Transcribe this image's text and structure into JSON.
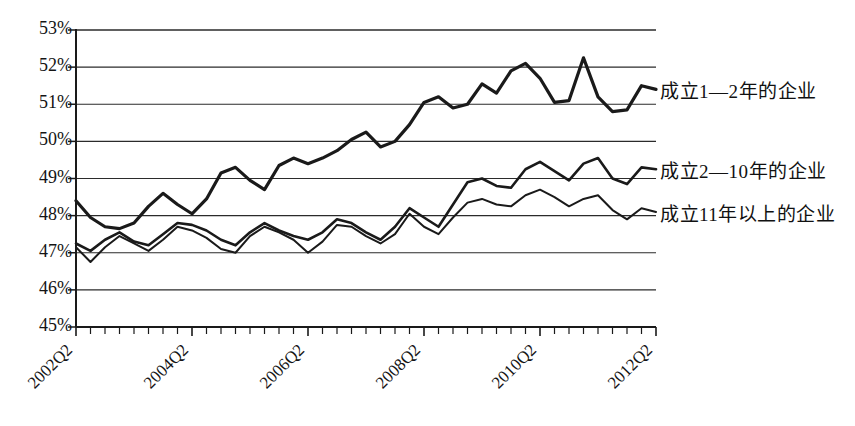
{
  "chart_data": {
    "type": "line",
    "title": "",
    "xlabel": "",
    "ylabel": "",
    "ylim": [
      45,
      53
    ],
    "ytick_labels": [
      "53%",
      "52%",
      "51%",
      "50%",
      "49%",
      "48%",
      "47%",
      "46%",
      "45%"
    ],
    "ytick_values": [
      53,
      52,
      51,
      50,
      49,
      48,
      47,
      46,
      45
    ],
    "grid": true,
    "legend_position": "right-inline",
    "x_start": "2002Q2",
    "x_end": "2012Q2",
    "x_tick_count": 41,
    "xtick_labels": [
      "2002Q2",
      "2004Q2",
      "2006Q2",
      "2008Q2",
      "2010Q2",
      "2012Q2"
    ],
    "xtick_indices": [
      0,
      8,
      16,
      24,
      32,
      40
    ],
    "x": [
      "2002Q2",
      "2002Q3",
      "2002Q4",
      "2003Q1",
      "2003Q2",
      "2003Q3",
      "2003Q4",
      "2004Q1",
      "2004Q2",
      "2004Q3",
      "2004Q4",
      "2005Q1",
      "2005Q2",
      "2005Q3",
      "2005Q4",
      "2006Q1",
      "2006Q2",
      "2006Q3",
      "2006Q4",
      "2007Q1",
      "2007Q2",
      "2007Q3",
      "2007Q4",
      "2008Q1",
      "2008Q2",
      "2008Q3",
      "2008Q4",
      "2009Q1",
      "2009Q2",
      "2009Q3",
      "2009Q4",
      "2010Q1",
      "2010Q2",
      "2010Q3",
      "2010Q4",
      "2011Q1",
      "2011Q2",
      "2011Q3",
      "2011Q4",
      "2012Q1",
      "2012Q2"
    ],
    "series": [
      {
        "name": "成立1—2年的企业",
        "color": "#1a1a1a",
        "width": 3.2,
        "values": [
          48.4,
          47.95,
          47.7,
          47.65,
          47.8,
          48.25,
          48.6,
          48.3,
          48.05,
          48.45,
          49.15,
          49.3,
          48.95,
          48.7,
          49.35,
          49.55,
          49.4,
          49.55,
          49.75,
          50.05,
          50.25,
          49.85,
          50.0,
          50.45,
          51.05,
          51.2,
          50.9,
          51.0,
          51.55,
          51.3,
          51.9,
          52.1,
          51.7,
          51.05,
          51.1,
          52.25,
          51.2,
          50.8,
          50.85,
          51.5,
          51.4
        ]
      },
      {
        "name": "成立2—10年的企业",
        "color": "#1a1a1a",
        "width": 2.6,
        "values": [
          47.25,
          47.05,
          47.35,
          47.55,
          47.3,
          47.2,
          47.5,
          47.8,
          47.75,
          47.6,
          47.35,
          47.2,
          47.55,
          47.8,
          47.6,
          47.45,
          47.35,
          47.55,
          47.9,
          47.8,
          47.55,
          47.35,
          47.7,
          48.2,
          47.95,
          47.7,
          48.3,
          48.9,
          49.0,
          48.8,
          48.75,
          49.25,
          49.45,
          49.2,
          48.95,
          49.4,
          49.55,
          49.0,
          48.85,
          49.3,
          49.25
        ]
      },
      {
        "name": "成立11年以上的企业",
        "color": "#1a1a1a",
        "width": 2.0,
        "values": [
          47.15,
          46.75,
          47.15,
          47.45,
          47.25,
          47.05,
          47.35,
          47.7,
          47.6,
          47.4,
          47.1,
          47.0,
          47.45,
          47.7,
          47.55,
          47.35,
          47.0,
          47.3,
          47.75,
          47.7,
          47.45,
          47.25,
          47.5,
          48.05,
          47.7,
          47.5,
          47.95,
          48.35,
          48.45,
          48.3,
          48.25,
          48.55,
          48.7,
          48.5,
          48.25,
          48.45,
          48.55,
          48.15,
          47.9,
          48.2,
          48.1
        ]
      }
    ],
    "legend_labels": [
      {
        "text": "成立1—2年的企业",
        "anchor_value": 51.4
      },
      {
        "text": "成立2—10年的企业",
        "anchor_value": 49.25
      },
      {
        "text": "成立11年以上的企业",
        "anchor_value": 48.1
      }
    ]
  },
  "axis": {
    "line_color": "#1a1a1a",
    "grid_color": "#2b2b2b"
  }
}
